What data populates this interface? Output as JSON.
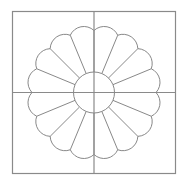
{
  "diagram": {
    "title": "",
    "colors": {
      "background": "#ffffff",
      "frame_stroke": "#8a8a8a",
      "pattern_stroke": "#7a7a7a"
    },
    "block": {
      "x": 12.5,
      "y": 11.5,
      "width": 163,
      "height": 162,
      "quadrant_divider_lines": 2
    },
    "plate": {
      "center_x": 94,
      "center_y": 92.5,
      "petal_count": 16,
      "inner_circle_radius": 20.5,
      "notch_radius": 62,
      "petal_tip_radius": 67,
      "scallop_arc_radius": 14.9,
      "start_angle_deg": -90
    }
  }
}
